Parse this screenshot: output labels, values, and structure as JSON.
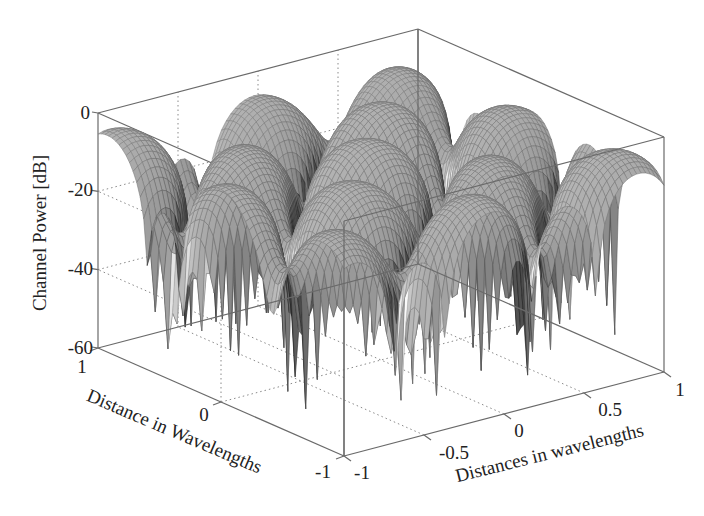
{
  "chart_data": {
    "type": "surface3d",
    "title": "",
    "xlabel": "Distances in wavelengths",
    "ylabel": "Distance in Wavelengths",
    "zlabel": "Channel Power [dB]",
    "x_ticks": [
      "-1",
      "-0.5",
      "0",
      "0.5",
      "1"
    ],
    "y_ticks": [
      "-1",
      "0",
      "1"
    ],
    "z_ticks": [
      "0",
      "-20",
      "-40",
      "-60"
    ],
    "xlim": [
      -1,
      1
    ],
    "ylim": [
      -1,
      1
    ],
    "zlim": [
      -60,
      0
    ],
    "grid": true,
    "colormap": "gray",
    "peak_db": -3,
    "typical_dome_db": -10,
    "null_db": -55
  },
  "labels": {
    "z_axis_title": "Channel Power [dB]",
    "y_axis_title": "Distance in Wavelengths",
    "x_axis_title": "Distances in wavelengths",
    "z_tick_0": "0",
    "z_tick_1": "-20",
    "z_tick_2": "-40",
    "z_tick_3": "-60",
    "y_tick_1": "1",
    "y_tick_0": "0",
    "y_tick_m1": "-1",
    "x_tick_m1": "-1",
    "x_tick_m05": "-0.5",
    "x_tick_0": "0",
    "x_tick_05": "0.5",
    "x_tick_1": "1"
  }
}
